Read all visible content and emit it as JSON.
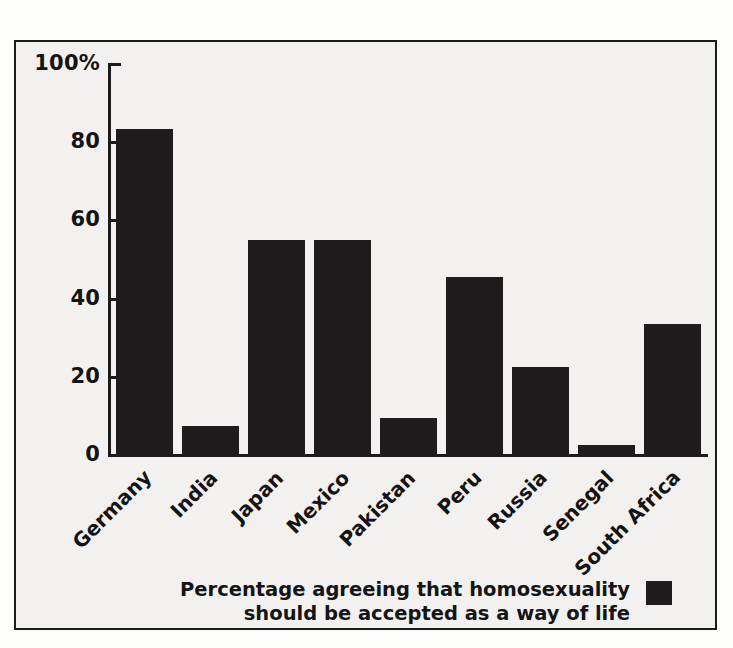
{
  "chart_data": {
    "type": "bar",
    "title": "",
    "subtitle": "",
    "xlabel": "",
    "ylabel": "",
    "ylim": [
      0,
      100
    ],
    "grid": false,
    "legend_position": "bottom-right",
    "bar_color": "#1e1c1c",
    "background_color": "#f3f1ef",
    "axis_color": "#1b1b1b",
    "categories": [
      "Germany",
      "India",
      "Japan",
      "Mexico",
      "Pakistan",
      "Peru",
      "Russia",
      "Senegal",
      "South Africa"
    ],
    "values": [
      83.5,
      7.5,
      55,
      55,
      9.5,
      45.5,
      22.5,
      2.5,
      33.5
    ],
    "ytick_values": [
      0,
      20,
      40,
      60,
      80,
      100
    ],
    "ytick_labels": [
      "0",
      "20",
      "40",
      "60",
      "80",
      "100%"
    ],
    "legend": [
      {
        "label_line_1": "Percentage agreeing that homosexuality",
        "label_line_2": "should be accepted as a way of life",
        "color": "#1e1c1c"
      }
    ]
  }
}
